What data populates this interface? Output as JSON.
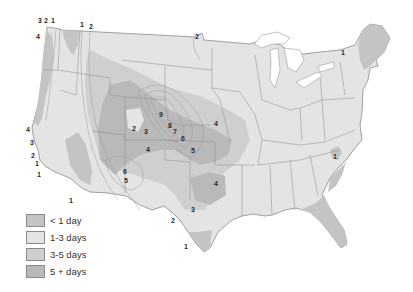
{
  "map": {
    "subject": "Contiguous United States",
    "colors": {
      "lt1": "#c4c4c4",
      "d1_3": "#e4e4e4",
      "d3_5": "#cfcfcf",
      "d5plus": "#b9b9b9",
      "border": "#8a8a8a",
      "water": "#ffffff"
    },
    "contour_labels": [
      {
        "text": "3",
        "x": 38,
        "y": 17
      },
      {
        "text": "2",
        "x": 44,
        "y": 17
      },
      {
        "text": "1",
        "x": 51,
        "y": 17
      },
      {
        "text": "4",
        "x": 36,
        "y": 33
      },
      {
        "text": "1",
        "x": 80,
        "y": 21
      },
      {
        "text": "2",
        "x": 89,
        "y": 23
      },
      {
        "text": "2",
        "x": 195,
        "y": 33
      },
      {
        "text": "1",
        "x": 341,
        "y": 49
      },
      {
        "text": "9",
        "x": 159,
        "y": 111
      },
      {
        "text": "8",
        "x": 168,
        "y": 122
      },
      {
        "text": "7",
        "x": 173,
        "y": 128
      },
      {
        "text": "6",
        "x": 181,
        "y": 135
      },
      {
        "text": "5",
        "x": 191,
        "y": 147
      },
      {
        "text": "2",
        "x": 132,
        "y": 125
      },
      {
        "text": "3",
        "x": 144,
        "y": 128
      },
      {
        "text": "4",
        "x": 146,
        "y": 146
      },
      {
        "text": "4",
        "x": 214,
        "y": 120
      },
      {
        "text": "6",
        "x": 123,
        "y": 168
      },
      {
        "text": "5",
        "x": 124,
        "y": 177
      },
      {
        "text": "4",
        "x": 214,
        "y": 180
      },
      {
        "text": "3",
        "x": 191,
        "y": 206
      },
      {
        "text": "2",
        "x": 171,
        "y": 217
      },
      {
        "text": "1",
        "x": 184,
        "y": 243
      },
      {
        "text": "1",
        "x": 333,
        "y": 153
      },
      {
        "text": "4",
        "x": 26,
        "y": 126
      },
      {
        "text": "3",
        "x": 30,
        "y": 139
      },
      {
        "text": "2",
        "x": 31,
        "y": 152
      },
      {
        "text": "1",
        "x": 35,
        "y": 160
      },
      {
        "text": "1",
        "x": 37,
        "y": 171
      },
      {
        "text": "1",
        "x": 69,
        "y": 197
      }
    ]
  },
  "legend": {
    "items": [
      {
        "label": "< 1 day",
        "color": "#c4c4c4"
      },
      {
        "label": "1-3 days",
        "color": "#e4e4e4"
      },
      {
        "label": "3-5 days",
        "color": "#cfcfcf"
      },
      {
        "label": "5 +  days",
        "color": "#b9b9b9"
      }
    ]
  }
}
